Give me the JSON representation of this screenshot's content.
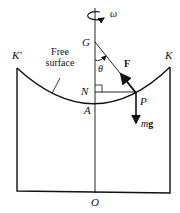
{
  "labels": {
    "omega": "ω",
    "G": "G",
    "theta": "θ",
    "F": "F",
    "K_prime": "K′",
    "K": "K",
    "free_surface_line1": "Free",
    "free_surface_line2": "surface",
    "N": "N",
    "P": "P",
    "A": "A",
    "mg_m": "m",
    "mg_g": "g",
    "O": "O"
  },
  "colors": {
    "stroke": "#111111",
    "background": "#ffffff"
  }
}
